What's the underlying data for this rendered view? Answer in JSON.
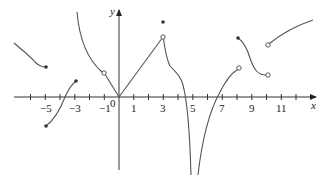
{
  "figure": {
    "type": "function-graph",
    "axes": {
      "x_label": "x",
      "y_label": "y",
      "origin_label": "0",
      "x_tick_labels": [
        "−5",
        "−3",
        "−1",
        "1",
        "3",
        "5",
        "7",
        "9",
        "11"
      ],
      "x_tick_values": [
        -5,
        -3,
        -1,
        1,
        3,
        5,
        7,
        9,
        11
      ],
      "x_range": [
        -7,
        13
      ]
    },
    "segments": [
      {
        "name": "curve-left-decreasing",
        "domain": [
          -6.9,
          -5
        ],
        "end": "filled"
      },
      {
        "name": "curve-increasing",
        "domain": [
          -5,
          -3
        ],
        "start": "filled",
        "end": "filled"
      },
      {
        "name": "curve-decreasing-to-open",
        "domain": [
          -2.9,
          -1
        ],
        "end": "open"
      },
      {
        "name": "line-from-open-to-origin",
        "domain": [
          -1,
          0
        ]
      },
      {
        "name": "line-origin-to-open",
        "domain": [
          0,
          3
        ],
        "end": "open"
      },
      {
        "name": "isolated-point",
        "x": 3,
        "style": "filled"
      },
      {
        "name": "curve-to-vertical-asymptote-left",
        "domain": [
          3,
          5
        ]
      },
      {
        "name": "curve-from-vertical-asymptote-right",
        "domain": [
          5.5,
          8
        ],
        "end": "open"
      },
      {
        "name": "curve-s-shape",
        "domain": [
          8,
          10
        ],
        "start": "filled",
        "end": "open"
      },
      {
        "name": "curve-rising-right",
        "domain": [
          10,
          13
        ],
        "start": "open"
      }
    ],
    "vertical_asymptote_x": 5
  }
}
